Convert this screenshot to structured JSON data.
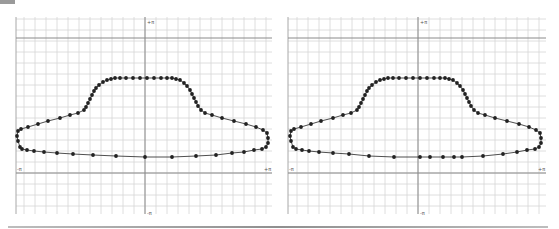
{
  "chart_data": [
    {
      "type": "scatter",
      "title": "",
      "xlabel": "",
      "ylabel": "",
      "x_tick_labels": [
        "-π",
        "+π"
      ],
      "y_tick_labels": [
        "+π",
        "-π"
      ],
      "grid": true,
      "description": "Closed car-body shaped outline traced with dot markers connected by a thin line",
      "points_px": [
        [
          20,
          147
        ],
        [
          18,
          141
        ],
        [
          17,
          136
        ],
        [
          18,
          131
        ],
        [
          21,
          129
        ],
        [
          28,
          127
        ],
        [
          38,
          124
        ],
        [
          48,
          121
        ],
        [
          60,
          118
        ],
        [
          70,
          115
        ],
        [
          78,
          113
        ],
        [
          84,
          110
        ],
        [
          86,
          107
        ],
        [
          88,
          103
        ],
        [
          90,
          99
        ],
        [
          92,
          95
        ],
        [
          94,
          91
        ],
        [
          96,
          88
        ],
        [
          99,
          85
        ],
        [
          103,
          82
        ],
        [
          107,
          80
        ],
        [
          111,
          79
        ],
        [
          115,
          78
        ],
        [
          120,
          78
        ],
        [
          126,
          78
        ],
        [
          133,
          78
        ],
        [
          140,
          78
        ],
        [
          147,
          78
        ],
        [
          154,
          78
        ],
        [
          161,
          78
        ],
        [
          167,
          78
        ],
        [
          172,
          78
        ],
        [
          176,
          79
        ],
        [
          180,
          80
        ],
        [
          184,
          83
        ],
        [
          187,
          86
        ],
        [
          190,
          90
        ],
        [
          192,
          94
        ],
        [
          194,
          98
        ],
        [
          196,
          102
        ],
        [
          198,
          106
        ],
        [
          201,
          110
        ],
        [
          205,
          113
        ],
        [
          212,
          115
        ],
        [
          222,
          118
        ],
        [
          234,
          121
        ],
        [
          246,
          124
        ],
        [
          256,
          127
        ],
        [
          263,
          130
        ],
        [
          267,
          133
        ],
        [
          268,
          138
        ],
        [
          268,
          143
        ],
        [
          266,
          147
        ],
        [
          262,
          149
        ],
        [
          254,
          150
        ],
        [
          244,
          152
        ],
        [
          232,
          153
        ],
        [
          216,
          155
        ],
        [
          196,
          156
        ],
        [
          172,
          157
        ],
        [
          145,
          157
        ],
        [
          116,
          156
        ],
        [
          93,
          155
        ],
        [
          73,
          154
        ],
        [
          57,
          153
        ],
        [
          44,
          152
        ],
        [
          34,
          151
        ],
        [
          27,
          150
        ],
        [
          22,
          149
        ]
      ]
    },
    {
      "type": "scatter",
      "title": "",
      "xlabel": "",
      "ylabel": "",
      "x_tick_labels": [
        "-π",
        "+π"
      ],
      "y_tick_labels": [
        "+π",
        "-π"
      ],
      "grid": true,
      "description": "Same car-body outline; bottom edge has a few extra samples near the center",
      "points_px": [
        [
          20,
          147
        ],
        [
          18,
          141
        ],
        [
          17,
          136
        ],
        [
          18,
          131
        ],
        [
          21,
          129
        ],
        [
          28,
          127
        ],
        [
          38,
          124
        ],
        [
          48,
          121
        ],
        [
          60,
          118
        ],
        [
          70,
          115
        ],
        [
          78,
          113
        ],
        [
          84,
          110
        ],
        [
          86,
          107
        ],
        [
          88,
          103
        ],
        [
          90,
          99
        ],
        [
          92,
          95
        ],
        [
          94,
          91
        ],
        [
          96,
          88
        ],
        [
          99,
          85
        ],
        [
          103,
          82
        ],
        [
          107,
          80
        ],
        [
          111,
          79
        ],
        [
          115,
          78
        ],
        [
          120,
          78
        ],
        [
          126,
          78
        ],
        [
          133,
          78
        ],
        [
          140,
          78
        ],
        [
          147,
          78
        ],
        [
          154,
          78
        ],
        [
          161,
          78
        ],
        [
          167,
          78
        ],
        [
          172,
          78
        ],
        [
          176,
          79
        ],
        [
          180,
          80
        ],
        [
          184,
          83
        ],
        [
          187,
          86
        ],
        [
          190,
          90
        ],
        [
          192,
          94
        ],
        [
          194,
          98
        ],
        [
          196,
          102
        ],
        [
          198,
          106
        ],
        [
          201,
          110
        ],
        [
          205,
          113
        ],
        [
          212,
          115
        ],
        [
          222,
          118
        ],
        [
          234,
          121
        ],
        [
          246,
          124
        ],
        [
          256,
          127
        ],
        [
          263,
          130
        ],
        [
          267,
          133
        ],
        [
          268,
          138
        ],
        [
          268,
          143
        ],
        [
          266,
          147
        ],
        [
          262,
          149
        ],
        [
          254,
          150
        ],
        [
          244,
          152
        ],
        [
          230,
          154
        ],
        [
          210,
          156
        ],
        [
          189,
          157
        ],
        [
          181,
          157
        ],
        [
          170,
          157
        ],
        [
          157,
          157
        ],
        [
          147,
          157
        ],
        [
          121,
          157
        ],
        [
          96,
          156
        ],
        [
          76,
          154
        ],
        [
          60,
          153
        ],
        [
          46,
          152
        ],
        [
          36,
          151
        ],
        [
          29,
          150
        ],
        [
          23,
          149
        ]
      ]
    }
  ],
  "plots": [
    {
      "x_min_label": "-π",
      "x_max_label": "+π",
      "y_max_label": "+π",
      "y_min_label": "-π"
    },
    {
      "x_min_label": "-π",
      "x_max_label": "+π",
      "y_max_label": "+π",
      "y_min_label": "-π"
    }
  ],
  "colors": {
    "grid": "#d6d6d6",
    "axis": "#8a8a8a",
    "curve": "#222222",
    "marker": "#222222"
  }
}
